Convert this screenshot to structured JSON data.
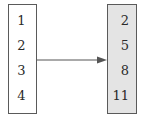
{
  "diagram": {
    "type": "mapping",
    "domain": {
      "values": [
        "1",
        "2",
        "3",
        "4"
      ]
    },
    "range": {
      "values": [
        "2",
        "5",
        "8",
        "11"
      ]
    },
    "arrow": {
      "direction": "left-to-right"
    },
    "colors": {
      "domain_fill": "#ffffff",
      "range_fill": "#e4e4e4",
      "border": "#5a5a5a",
      "arrow": "#555555"
    }
  }
}
